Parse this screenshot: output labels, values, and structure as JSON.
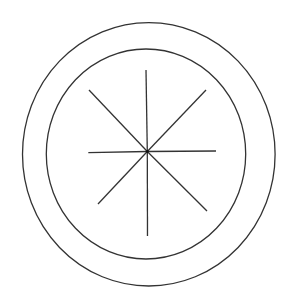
{
  "canvas": {
    "width": 294,
    "height": 308,
    "background": "#ffffff"
  },
  "style": {
    "stroke": "#333333",
    "stroke_width": 1.3
  },
  "diagram": {
    "circles": [
      {
        "name": "outer-circle",
        "cx": 148.8,
        "cy": 154.3,
        "rx": 126.3,
        "ry": 131.7
      },
      {
        "name": "inner-circle",
        "cx": 146.0,
        "cy": 154.0,
        "rx": 99.7,
        "ry": 105.0
      }
    ],
    "center": {
      "x": 147.3,
      "y": 151.5
    },
    "spokes": [
      {
        "name": "spoke-north",
        "x": 146.0,
        "y": 70.0
      },
      {
        "name": "spoke-north-east",
        "x": 206.0,
        "y": 90.0
      },
      {
        "name": "spoke-east",
        "x": 216.0,
        "y": 151.0
      },
      {
        "name": "spoke-south-east",
        "x": 207.0,
        "y": 211.0
      },
      {
        "name": "spoke-south",
        "x": 147.5,
        "y": 236.0
      },
      {
        "name": "spoke-south-west",
        "x": 98.0,
        "y": 204.0
      },
      {
        "name": "spoke-west",
        "x": 88.3,
        "y": 152.7
      },
      {
        "name": "spoke-north-west",
        "x": 89.0,
        "y": 90.0
      }
    ]
  }
}
